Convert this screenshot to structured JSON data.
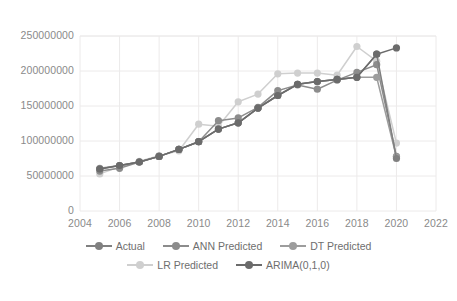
{
  "chart_data": {
    "type": "line",
    "title": "",
    "xlabel": "",
    "ylabel": "",
    "xlim": [
      2004,
      2022
    ],
    "ylim": [
      0,
      250000000
    ],
    "x_ticks": [
      2004,
      2006,
      2008,
      2010,
      2012,
      2014,
      2016,
      2018,
      2020,
      2022
    ],
    "y_ticks": [
      0,
      50000000,
      100000000,
      150000000,
      200000000,
      250000000
    ],
    "grid": "horizontal-and-vertical-light",
    "legend_position": "bottom",
    "x": [
      2005,
      2006,
      2007,
      2008,
      2009,
      2010,
      2011,
      2012,
      2013,
      2014,
      2015,
      2016,
      2017,
      2018,
      2019,
      2020
    ],
    "series": [
      {
        "name": "Actual",
        "color": "#808080",
        "values": [
          60000000,
          65000000,
          70000000,
          78000000,
          88000000,
          99000000,
          117000000,
          126000000,
          147000000,
          165000000,
          181000000,
          185000000,
          188000000,
          191000000,
          224000000,
          75000000
        ]
      },
      {
        "name": "ANN Predicted",
        "color": "#8c8c8c",
        "values": [
          57000000,
          61000000,
          70000000,
          78000000,
          88000000,
          99000000,
          129000000,
          133000000,
          148000000,
          172000000,
          180000000,
          174000000,
          187000000,
          198000000,
          209000000,
          78000000
        ]
      },
      {
        "name": "DT Predicted",
        "color": "#9d9d9d",
        "values": [
          61000000,
          65000000,
          70000000,
          78000000,
          88000000,
          99000000,
          117000000,
          126000000,
          147000000,
          165000000,
          181000000,
          185000000,
          188000000,
          191000000,
          191000000,
          77000000
        ]
      },
      {
        "name": "LR Predicted",
        "color": "#cfcfcf",
        "values": [
          53000000,
          63000000,
          71000000,
          79000000,
          86000000,
          124000000,
          121000000,
          156000000,
          167000000,
          196000000,
          197000000,
          197000000,
          194000000,
          235000000,
          214000000,
          97000000
        ]
      },
      {
        "name": "ARIMA(0,1,0)",
        "color": "#6b6b6b",
        "values": [
          60000000,
          65000000,
          70000000,
          78000000,
          88000000,
          99000000,
          117000000,
          126000000,
          147000000,
          165000000,
          181000000,
          185000000,
          188000000,
          191000000,
          224000000,
          233000000
        ]
      }
    ]
  },
  "axis": {
    "y_tick_labels": [
      "250000000",
      "200000000",
      "150000000",
      "100000000",
      "50000000",
      "0"
    ],
    "x_tick_labels": [
      "2004",
      "2006",
      "2008",
      "2010",
      "2012",
      "2014",
      "2016",
      "2018",
      "2020",
      "2022"
    ]
  },
  "legend": {
    "rows": [
      [
        {
          "label": "Actual",
          "color": "#808080"
        },
        {
          "label": "ANN Predicted",
          "color": "#8c8c8c"
        },
        {
          "label": "DT Predicted",
          "color": "#9d9d9d"
        }
      ],
      [
        {
          "label": "LR Predicted",
          "color": "#cfcfcf"
        },
        {
          "label": "ARIMA(0,1,0)",
          "color": "#6b6b6b"
        }
      ]
    ]
  },
  "colors": {
    "grid": "#eceaea",
    "axis_text": "#8a8a8a",
    "legend_text": "#6e6e6e",
    "background": "#ffffff"
  }
}
